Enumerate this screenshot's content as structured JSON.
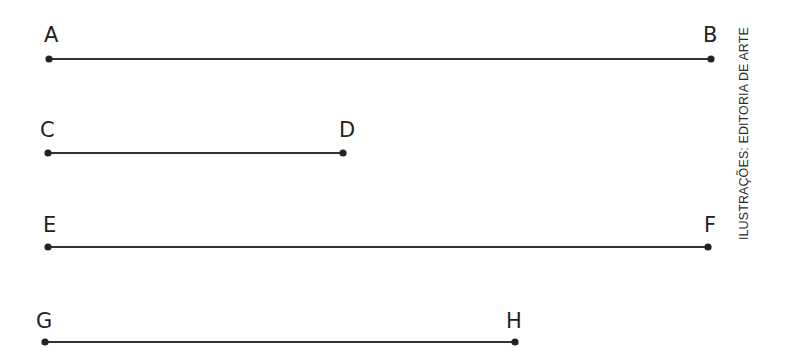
{
  "figure": {
    "credit": "ILUSTRAÇÕES: EDITORIA DE ARTE",
    "line_color": "#333333",
    "segments": [
      {
        "name": "AB",
        "start": {
          "label": "A",
          "x": 49,
          "y": 59
        },
        "end": {
          "label": "B",
          "x": 711,
          "y": 59
        }
      },
      {
        "name": "CD",
        "start": {
          "label": "C",
          "x": 48,
          "y": 153
        },
        "end": {
          "label": "D",
          "x": 343,
          "y": 153
        }
      },
      {
        "name": "EF",
        "start": {
          "label": "E",
          "x": 48,
          "y": 247
        },
        "end": {
          "label": "F",
          "x": 708,
          "y": 247
        }
      },
      {
        "name": "GH",
        "start": {
          "label": "G",
          "x": 45,
          "y": 342
        },
        "end": {
          "label": "H",
          "x": 515,
          "y": 342
        }
      }
    ]
  }
}
